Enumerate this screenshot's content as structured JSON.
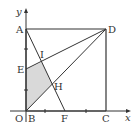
{
  "diagram": {
    "axes": {
      "x_label": "x",
      "y_label": "y"
    },
    "points": {
      "A": "A",
      "D": "D",
      "E": "E",
      "I": "I",
      "H": "H",
      "O": "O",
      "B": "B",
      "F": "F",
      "C": "C"
    },
    "colors": {
      "line": "#333333",
      "shade": "#d9d9d9"
    }
  }
}
